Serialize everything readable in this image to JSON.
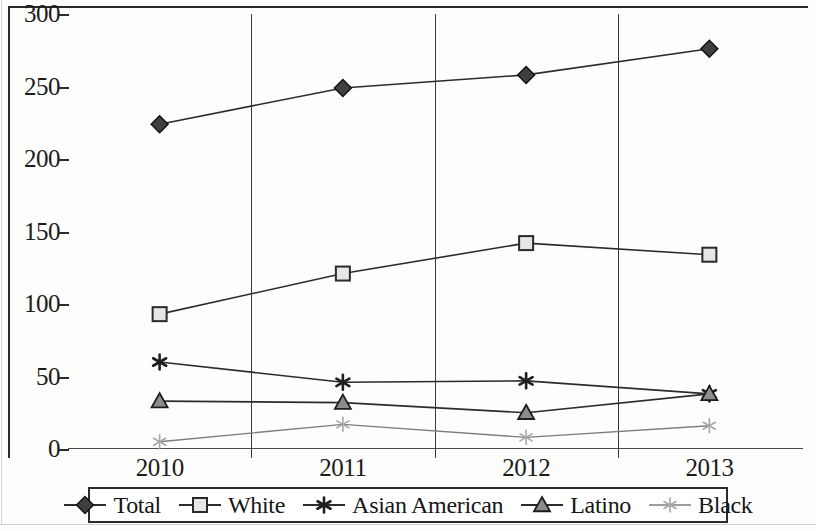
{
  "chart_data": {
    "type": "line",
    "title": "",
    "subtitle": "",
    "xlabel": "",
    "ylabel": "",
    "categories": [
      "2010",
      "2011",
      "2012",
      "2013"
    ],
    "ylim": [
      0,
      300
    ],
    "yticks": [
      0,
      50,
      100,
      150,
      200,
      250,
      300
    ],
    "ytick_labels": [
      "0",
      "50",
      "100",
      "150",
      "200",
      "250",
      "300"
    ],
    "grid": "vertical category separators only",
    "legend_position": "bottom",
    "series": [
      {
        "name": "Total",
        "marker": "filled-diamond",
        "color": "#3d3d3d",
        "values": [
          224,
          249,
          258,
          276
        ]
      },
      {
        "name": "White",
        "marker": "open-square",
        "color": "#4a4a4a",
        "values": [
          93,
          121,
          142,
          134
        ]
      },
      {
        "name": "Asian American",
        "marker": "asterisk",
        "color": "#2e2e2e",
        "values": [
          60,
          46,
          47,
          38
        ]
      },
      {
        "name": "Latino",
        "marker": "open-triangle",
        "color": "#484848",
        "values": [
          33,
          32,
          25,
          38
        ]
      },
      {
        "name": "Black",
        "marker": "light-asterisk",
        "color": "#9a9a9a",
        "values": [
          5,
          17,
          8,
          16
        ]
      }
    ]
  },
  "axes": {
    "y_tick_labels": [
      "300",
      "250",
      "200",
      "150",
      "100",
      "50",
      "0"
    ],
    "x_tick_labels": [
      "2010",
      "2011",
      "2012",
      "2013"
    ]
  },
  "legend": {
    "entries": [
      {
        "label": "Total",
        "marker": "filled-diamond"
      },
      {
        "label": "White",
        "marker": "open-square"
      },
      {
        "label": "Asian American",
        "marker": "asterisk"
      },
      {
        "label": "Latino",
        "marker": "open-triangle"
      },
      {
        "label": "Black",
        "marker": "light-asterisk"
      }
    ]
  }
}
